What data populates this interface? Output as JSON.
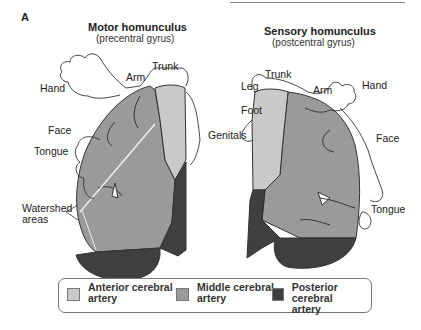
{
  "panel_label": "A",
  "colors": {
    "anterior": "#c9c9c9",
    "middle": "#9a9a9a",
    "posterior": "#3f3f3f",
    "outline": "#333333"
  },
  "motor": {
    "title": "Motor homunculus",
    "subtitle": "(precentral gyrus)",
    "labels": {
      "hand": "Hand",
      "arm": "Arm",
      "trunk": "Trunk",
      "face": "Face",
      "tongue": "Tongue",
      "watershed": "Watershed",
      "watershed2": "areas"
    }
  },
  "sensory": {
    "title": "Sensory homunculus",
    "subtitle": "(postcentral gyrus)",
    "labels": {
      "leg": "Leg",
      "trunk": "Trunk",
      "arm": "Arm",
      "hand": "Hand",
      "foot": "Foot",
      "genitals": "Genitals",
      "face": "Face",
      "tongue": "Tongue"
    }
  },
  "legend": [
    {
      "line1": "Anterior cerebral",
      "line2": "artery"
    },
    {
      "line1": "Middle cerebral",
      "line2": "artery"
    },
    {
      "line1": "Posterior cerebral",
      "line2": "artery"
    }
  ]
}
